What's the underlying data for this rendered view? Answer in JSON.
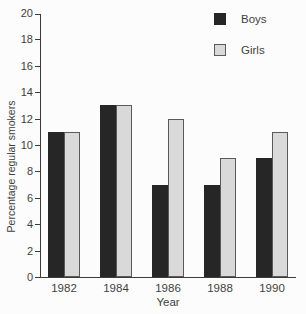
{
  "chart_data": {
    "type": "bar",
    "title": "",
    "categories": [
      "1982",
      "1984",
      "1986",
      "1988",
      "1990"
    ],
    "series": [
      {
        "name": "Boys",
        "color": "#262626",
        "border_color": "#262626",
        "values": [
          11,
          13,
          7,
          7,
          9
        ]
      },
      {
        "name": "Girls",
        "color": "#d9d9d9",
        "border_color": "#5a5a5a",
        "values": [
          11,
          13,
          12,
          9,
          11
        ]
      }
    ],
    "xlabel": "Year",
    "ylabel": "Percentage regular smokers",
    "ylim": [
      0,
      20
    ],
    "yticks": [
      0,
      2,
      4,
      6,
      8,
      10,
      12,
      14,
      16,
      18,
      20
    ],
    "grid": false,
    "legend_position": "top-right",
    "axis_color": "#3c3c3c",
    "text_color": "#3f3f3f",
    "background_color": "#fcfcfc"
  }
}
